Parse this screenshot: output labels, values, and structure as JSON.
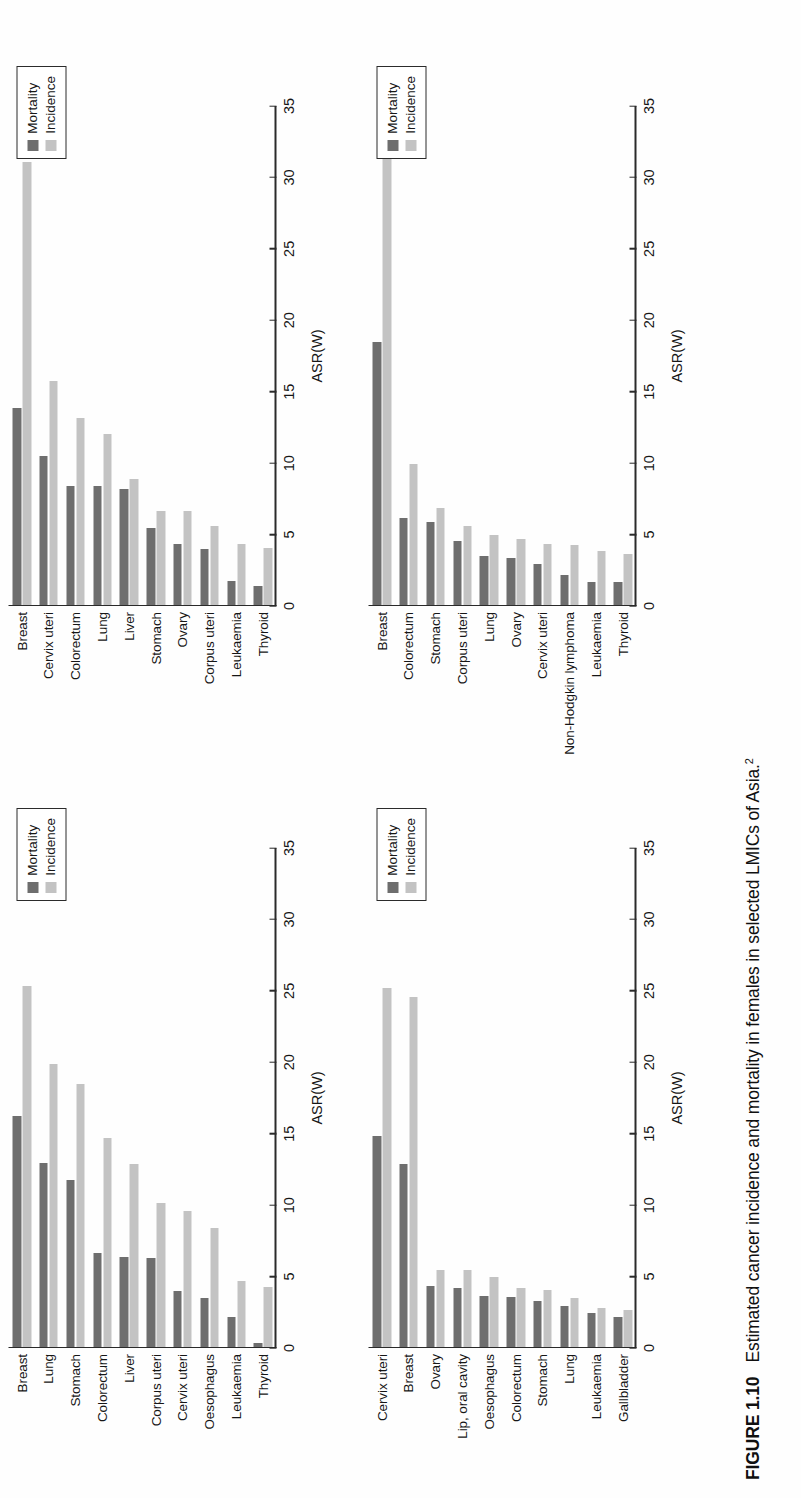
{
  "figure": {
    "number_label": "FIGURE 1.10",
    "caption_text": "Estimated cancer incidence and mortality in females in selected LMICs of Asia.",
    "caption_superscript": "2"
  },
  "legend": {
    "mortality_label": "Mortality",
    "incidence_label": "Incidence",
    "mortality_color": "#6e6e6e",
    "incidence_color": "#c3c3c3"
  },
  "axis": {
    "xlabel": "ASR(W)",
    "ticks": [
      "0",
      "5",
      "10",
      "15",
      "20",
      "25",
      "30",
      "35"
    ],
    "min": 0,
    "max": 35
  },
  "chart_data": [
    {
      "id": "panel-top-left",
      "type": "bar",
      "orientation": "horizontal",
      "title": "",
      "xlabel": "ASR(W)",
      "ylabel": "",
      "xlim": [
        0,
        35
      ],
      "grid": false,
      "legend_position": "top-right",
      "categories": [
        "Breast",
        "Lung",
        "Stomach",
        "Colorectum",
        "Liver",
        "Corpus uteri",
        "Cervix uteri",
        "Oesophagus",
        "Leukaemia",
        "Thyroid"
      ],
      "series": [
        {
          "name": "Mortality",
          "values": [
            16.2,
            12.9,
            11.7,
            6.6,
            6.3,
            6.2,
            3.9,
            3.4,
            2.1,
            0.3
          ]
        },
        {
          "name": "Incidence",
          "values": [
            25.3,
            19.8,
            18.4,
            14.6,
            12.8,
            10.1,
            9.5,
            8.3,
            4.6,
            4.2
          ]
        }
      ]
    },
    {
      "id": "panel-top-right",
      "type": "bar",
      "orientation": "horizontal",
      "title": "",
      "xlabel": "ASR(W)",
      "ylabel": "",
      "xlim": [
        0,
        35
      ],
      "grid": false,
      "legend_position": "top-right",
      "categories": [
        "Breast",
        "Cervix uteri",
        "Colorectum",
        "Lung",
        "Liver",
        "Stomach",
        "Ovary",
        "Corpus uteri",
        "Leukaemia",
        "Thyroid"
      ],
      "series": [
        {
          "name": "Mortality",
          "values": [
            13.8,
            10.4,
            8.3,
            8.3,
            8.1,
            5.4,
            4.3,
            3.9,
            1.7,
            1.3
          ]
        },
        {
          "name": "Incidence",
          "values": [
            31.0,
            15.7,
            13.1,
            12.0,
            8.8,
            6.6,
            6.6,
            5.5,
            4.3,
            4.0
          ]
        }
      ]
    },
    {
      "id": "panel-bottom-left",
      "type": "bar",
      "orientation": "horizontal",
      "title": "",
      "xlabel": "ASR(W)",
      "ylabel": "",
      "xlim": [
        0,
        35
      ],
      "grid": false,
      "legend_position": "top-right",
      "categories": [
        "Cervix uteri",
        "Breast",
        "Ovary",
        "Lip, oral cavity",
        "Oesophagus",
        "Colorectum",
        "Stomach",
        "Lung",
        "Leukaemia",
        "Gallbladder"
      ],
      "series": [
        {
          "name": "Mortality",
          "values": [
            14.8,
            12.8,
            4.3,
            4.1,
            3.6,
            3.5,
            3.2,
            2.9,
            2.4,
            2.1
          ]
        },
        {
          "name": "Incidence",
          "values": [
            25.1,
            24.5,
            5.4,
            5.4,
            4.9,
            4.1,
            4.0,
            3.4,
            2.7,
            2.6
          ]
        }
      ]
    },
    {
      "id": "panel-bottom-right",
      "type": "bar",
      "orientation": "horizontal",
      "title": "",
      "xlabel": "ASR(W)",
      "ylabel": "",
      "xlim": [
        0,
        35
      ],
      "grid": false,
      "legend_position": "top-right",
      "categories": [
        "Breast",
        "Colorectum",
        "Stomach",
        "Corpus uteri",
        "Lung",
        "Ovary",
        "Cervix uteri",
        "Non-Hodgkin lymphoma",
        "Leukaemia",
        "Thyroid"
      ],
      "series": [
        {
          "name": "Mortality",
          "values": [
            18.4,
            6.1,
            5.8,
            4.5,
            3.4,
            3.3,
            2.9,
            2.1,
            1.6,
            1.6
          ]
        },
        {
          "name": "Incidence",
          "values": [
            33.0,
            9.9,
            6.8,
            5.5,
            4.9,
            4.6,
            4.3,
            4.2,
            3.8,
            3.6
          ]
        }
      ]
    }
  ]
}
